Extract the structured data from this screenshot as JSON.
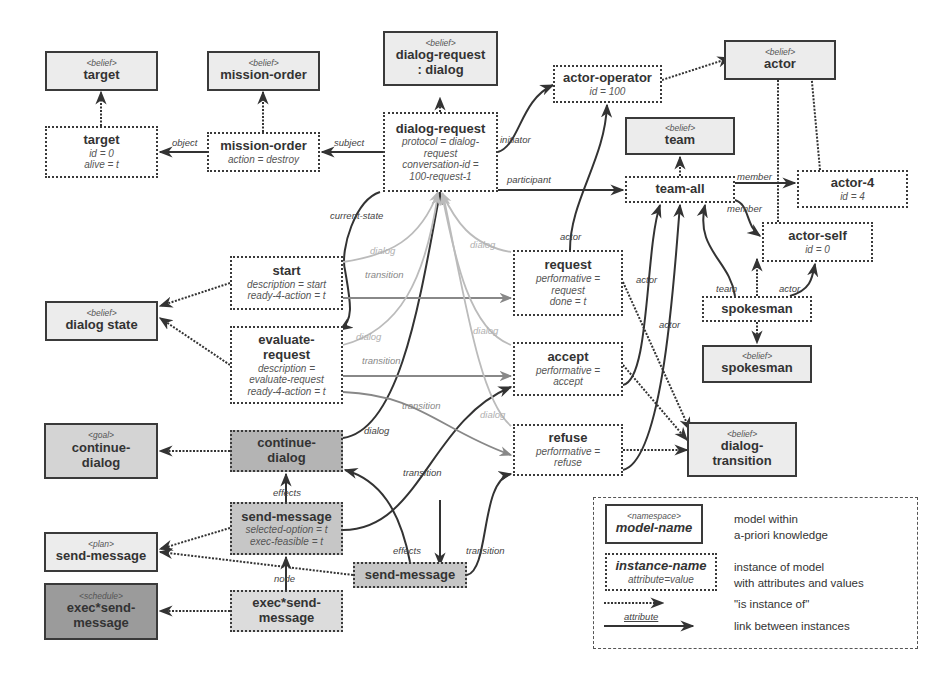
{
  "models": {
    "target": {
      "stereo": "<belief>",
      "title": "target"
    },
    "mission_order": {
      "stereo": "<belief>",
      "title": "mission-order"
    },
    "dialog_request": {
      "stereo": "<belief>",
      "title": "dialog-request\n: dialog"
    },
    "actor": {
      "stereo": "<belief>",
      "title": "actor"
    },
    "team": {
      "stereo": "<belief>",
      "title": "team"
    },
    "dialog_state": {
      "stereo": "<belief>",
      "title": "dialog state"
    },
    "spokesman": {
      "stereo": "<belief>",
      "title": "spokesman"
    },
    "dialog_transition": {
      "stereo": "<belief>",
      "title": "dialog-\ntransition"
    },
    "continue_dialog": {
      "stereo": "<goal>",
      "title": "continue-\ndialog"
    },
    "send_message": {
      "stereo": "<plan>",
      "title": "send-message"
    },
    "exec_send_message": {
      "stereo": "<schedule>",
      "title": "exec*send-\nmessage"
    }
  },
  "instances": {
    "target": {
      "title": "target",
      "attrs": [
        "id = 0",
        "alive = t"
      ]
    },
    "mission_order": {
      "title": "mission-order",
      "attrs": [
        "action = destroy"
      ]
    },
    "dialog_request": {
      "title": "dialog-request",
      "attrs": [
        "protocol = dialog-",
        "request",
        "conversation-id =",
        "100-request-1"
      ]
    },
    "actor_operator": {
      "title": "actor-operator",
      "attrs": [
        "id = 100"
      ]
    },
    "team_all": {
      "title": "team-all",
      "attrs": []
    },
    "actor_4": {
      "title": "actor-4",
      "attrs": [
        "id = 4"
      ]
    },
    "actor_self": {
      "title": "actor-self",
      "attrs": [
        "id = 0"
      ]
    },
    "spokesman": {
      "title": "spokesman",
      "attrs": []
    },
    "start": {
      "title": "start",
      "attrs": [
        "description = start",
        "ready-4-action = t"
      ]
    },
    "evaluate_request": {
      "title": "evaluate-\nrequest",
      "attrs": [
        "description =",
        "evaluate-request",
        "ready-4-action = t"
      ]
    },
    "request": {
      "title": "request",
      "attrs": [
        "performative =",
        "request",
        "done = t"
      ]
    },
    "accept": {
      "title": "accept",
      "attrs": [
        "performative =",
        "accept"
      ]
    },
    "refuse": {
      "title": "refuse",
      "attrs": [
        "performative =",
        "refuse"
      ]
    },
    "continue_dialog": {
      "title": "continue-\ndialog",
      "attrs": []
    },
    "send_message_plan": {
      "title": "send-message",
      "attrs": [
        "selected-option = t",
        "exec-feasible = t"
      ]
    },
    "send_message_node": {
      "title": "send-message",
      "attrs": []
    },
    "exec_send_message": {
      "title": "exec*send-\nmessage",
      "attrs": []
    }
  },
  "edge_labels": {
    "object": "object",
    "subject": "subject",
    "initiator": "initiator",
    "participant": "participant",
    "member1": "member",
    "member2": "member",
    "current_state": "current-state",
    "dialog_start": "dialog",
    "transition_start": "transition",
    "dialog_eval": "dialog",
    "transition_eval": "transition",
    "transition_eval_refuse": "transition",
    "dialog_request": "dialog",
    "dialog_accept": "dialog",
    "dialog_refuse": "dialog",
    "actor_request": "actor",
    "actor_accept": "actor",
    "actor_refuse": "actor",
    "team": "team",
    "actor_spokesman": "actor",
    "dialog_continue": "dialog",
    "effects1": "effects",
    "effects2": "effects",
    "transition_plan": "transition",
    "transition_node": "transition",
    "node": "node"
  },
  "legend": {
    "model_stereo": "<namespace>",
    "model_title": "model-name",
    "model_desc": "model within\na-priori knowledge",
    "instance_title": "instance-name",
    "instance_attr": "attribute=value",
    "instance_desc": "instance of model\nwith attributes and values",
    "instanceof_desc": "\"is instance of\"",
    "link_label": "attribute",
    "link_desc": "link between instances"
  }
}
